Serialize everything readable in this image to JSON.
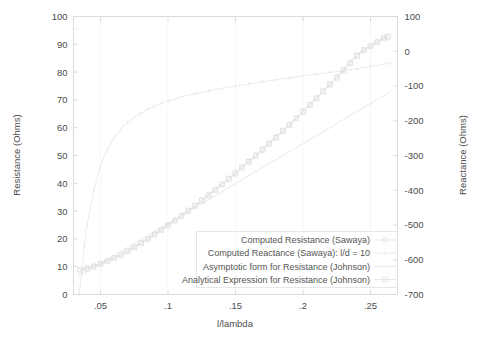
{
  "chart_data": {
    "type": "line",
    "title": "",
    "xlabel": "l/lambda",
    "ylabel": "Resistance (Ohms)",
    "y2label": "Reactance (Ohms)",
    "xlim": [
      0.03,
      0.27
    ],
    "ylim": [
      0,
      100
    ],
    "y2lim": [
      -700,
      100
    ],
    "grid": false,
    "legend_position": "bottom-right-inside",
    "x_ticks": [
      ".05",
      ".1",
      ".15",
      ".2",
      ".25"
    ],
    "x_tick_values": [
      0.05,
      0.1,
      0.15,
      0.2,
      0.25
    ],
    "y_ticks": [
      "0",
      "10",
      "20",
      "30",
      "40",
      "50",
      "60",
      "70",
      "80",
      "90",
      "100"
    ],
    "y_tick_values": [
      0,
      10,
      20,
      30,
      40,
      50,
      60,
      70,
      80,
      90,
      100
    ],
    "y2_ticks": [
      "-700",
      "-600",
      "-500",
      "-400",
      "-300",
      "-200",
      "-100",
      "0",
      "100"
    ],
    "y2_tick_values": [
      -700,
      -600,
      -500,
      -400,
      -300,
      -200,
      -100,
      0,
      100
    ],
    "series": [
      {
        "name": "Computed Resistance (Sawaya)",
        "axis": "left",
        "marker": "circle",
        "color": "#dcdcdc",
        "x": [
          0.035,
          0.04,
          0.045,
          0.05,
          0.055,
          0.06,
          0.065,
          0.07,
          0.075,
          0.08,
          0.085,
          0.09,
          0.095,
          0.1,
          0.105,
          0.11,
          0.115,
          0.12,
          0.125,
          0.13,
          0.135,
          0.14,
          0.145,
          0.15,
          0.155,
          0.16,
          0.165,
          0.17,
          0.175,
          0.18,
          0.185,
          0.19,
          0.195,
          0.2,
          0.205,
          0.21,
          0.215,
          0.22,
          0.225,
          0.23,
          0.235,
          0.24,
          0.245,
          0.25,
          0.255,
          0.26,
          0.263
        ],
        "y": [
          9.0,
          9.6,
          10.3,
          11.2,
          12.2,
          13.3,
          14.5,
          15.8,
          17.2,
          18.7,
          20.2,
          21.8,
          23.4,
          25.1,
          26.8,
          28.5,
          30.3,
          32.1,
          34.0,
          35.9,
          37.8,
          39.8,
          41.8,
          43.8,
          45.9,
          48.0,
          50.1,
          52.3,
          54.5,
          56.7,
          59.0,
          61.3,
          63.6,
          66.0,
          68.4,
          70.8,
          73.3,
          75.8,
          78.3,
          80.9,
          83.5,
          86.1,
          88.1,
          89.6,
          91.0,
          92.4,
          93.0
        ]
      },
      {
        "name": "Computed Reactance (Sawaya): l/d = 10",
        "axis": "right",
        "marker": "dot",
        "color": "#e4e4e4",
        "x": [
          0.034,
          0.036,
          0.038,
          0.04,
          0.045,
          0.05,
          0.055,
          0.06,
          0.065,
          0.07,
          0.075,
          0.08,
          0.085,
          0.09,
          0.095,
          0.1,
          0.11,
          0.12,
          0.13,
          0.14,
          0.15,
          0.16,
          0.17,
          0.18,
          0.19,
          0.2,
          0.21,
          0.22,
          0.23,
          0.24,
          0.25,
          0.26,
          0.265
        ],
        "y": [
          -700,
          -640,
          -560,
          -500,
          -400,
          -330,
          -283,
          -250,
          -225,
          -205,
          -190,
          -178,
          -167,
          -158,
          -150,
          -143,
          -131,
          -122,
          -114,
          -107,
          -100,
          -94,
          -88,
          -82,
          -77,
          -71,
          -66,
          -61,
          -56,
          -50,
          -44,
          -37,
          -33
        ]
      },
      {
        "name": "Asymptotic form for Resistance (Johnson)",
        "axis": "left",
        "marker": "none",
        "color": "#e0e0e0",
        "x": [
          0.034,
          0.265
        ],
        "y": [
          6.5,
          73.0
        ]
      },
      {
        "name": "Analytical Expression for Resistance (Johnson)",
        "axis": "left",
        "marker": "square",
        "color": "#dedede",
        "x": [
          0.035,
          0.04,
          0.045,
          0.05,
          0.055,
          0.06,
          0.065,
          0.07,
          0.075,
          0.08,
          0.085,
          0.09,
          0.095,
          0.1,
          0.105,
          0.11,
          0.115,
          0.12,
          0.125,
          0.13,
          0.135,
          0.14,
          0.145,
          0.15,
          0.155,
          0.16,
          0.165,
          0.17,
          0.175,
          0.18,
          0.185,
          0.19,
          0.195,
          0.2,
          0.205,
          0.21,
          0.215,
          0.22,
          0.225,
          0.23,
          0.235,
          0.24,
          0.245,
          0.25,
          0.255,
          0.26,
          0.263
        ],
        "y": [
          8.6,
          9.3,
          10.0,
          10.9,
          11.9,
          13.0,
          14.2,
          15.5,
          16.9,
          18.4,
          19.9,
          21.5,
          23.1,
          24.8,
          26.5,
          28.2,
          30.0,
          31.8,
          33.7,
          35.6,
          37.5,
          39.5,
          41.5,
          43.5,
          45.6,
          47.7,
          49.8,
          52.0,
          54.2,
          56.4,
          58.7,
          61.0,
          63.3,
          65.7,
          68.1,
          70.5,
          73.0,
          75.5,
          78.0,
          80.6,
          83.2,
          85.8,
          87.8,
          89.3,
          90.7,
          92.1,
          92.7
        ]
      }
    ]
  },
  "legend": {
    "entries": [
      {
        "label": "Computed Resistance (Sawaya)",
        "marker": "circle"
      },
      {
        "label": "Computed Reactance (Sawaya): l/d = 10",
        "marker": "dot"
      },
      {
        "label": "Asymptotic form for Resistance (Johnson)",
        "marker": "none"
      },
      {
        "label": "Analytical Expression for Resistance (Johnson)",
        "marker": "square"
      }
    ]
  },
  "colors": {
    "background": "#ffffff",
    "frame": "#d8d8d8",
    "text": "#4d4d4d",
    "series_faint": "#dedede"
  }
}
